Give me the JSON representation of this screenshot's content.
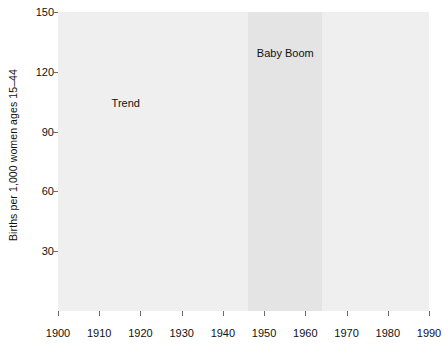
{
  "chart_data": {
    "type": "line",
    "title": "",
    "xlabel": "",
    "ylabel": "Births per 1,000 women ages 15–44",
    "xlim": [
      1900,
      1990
    ],
    "ylim": [
      0,
      150
    ],
    "yticks": [
      150,
      120,
      90,
      60,
      30
    ],
    "xticks": [
      1900,
      1910,
      1920,
      1930,
      1940,
      1950,
      1960,
      1970,
      1980,
      1990
    ],
    "grid": "horizontal-white",
    "legend": "none",
    "annotations": [
      {
        "text": "Trend",
        "x": 1913,
        "y": 104
      },
      {
        "text": "Baby Boom",
        "x": 1956,
        "y": 129
      }
    ],
    "shaded_bands": [
      {
        "label": "pre-boom",
        "x0": 1900,
        "x1": 1946,
        "color": "#efefef"
      },
      {
        "label": "baby-boom",
        "x0": 1946,
        "x1": 1964,
        "color": "#e4e4e4"
      },
      {
        "label": "post-boom",
        "x0": 1964,
        "x1": 1990,
        "color": "#efefef"
      }
    ],
    "series": [
      {
        "name": "Birth rate",
        "color": "#4a4a4a",
        "width": 2.6,
        "x": [
          1900,
          1901,
          1902,
          1903,
          1904,
          1905,
          1906,
          1907,
          1908,
          1909,
          1910,
          1911,
          1912,
          1913,
          1914,
          1915,
          1916,
          1917,
          1918,
          1919,
          1920,
          1921,
          1922,
          1923,
          1924,
          1925,
          1926,
          1927,
          1928,
          1929,
          1930,
          1931,
          1932,
          1933,
          1934,
          1935,
          1936,
          1937,
          1938,
          1939,
          1940,
          1941,
          1942,
          1943,
          1944,
          1945,
          1946,
          1947,
          1948,
          1949,
          1950,
          1951,
          1952,
          1953,
          1954,
          1955,
          1956,
          1957,
          1958,
          1959,
          1960,
          1961,
          1962,
          1963,
          1964,
          1965,
          1966,
          1967,
          1968,
          1969,
          1970,
          1971,
          1972,
          1973,
          1974,
          1975,
          1976,
          1977,
          1978,
          1979,
          1980,
          1981,
          1982,
          1983,
          1984,
          1985,
          1986,
          1987,
          1988,
          1989,
          1990
        ],
        "values": [
          120.0,
          120.5,
          121.0,
          121.0,
          121.5,
          122.0,
          122.5,
          123.0,
          124.0,
          124.5,
          126.5,
          126.0,
          126.5,
          127.0,
          127.0,
          126.5,
          124.0,
          123.0,
          121.0,
          111.5,
          117.5,
          118.5,
          112.5,
          111.0,
          110.5,
          108.0,
          104.0,
          101.5,
          97.0,
          93.5,
          89.5,
          85.0,
          81.5,
          76.5,
          78.5,
          77.0,
          76.0,
          77.5,
          79.0,
          77.5,
          79.5,
          83.5,
          91.5,
          95.5,
          88.5,
          86.0,
          101.5,
          122.5,
          114.0,
          113.5,
          113.0,
          115.5,
          116.5,
          116.5,
          118.0,
          118.5,
          120.0,
          121.0,
          119.5,
          118.5,
          118.0,
          117.0,
          113.0,
          108.0,
          104.5,
          97.0,
          91.5,
          87.0,
          85.5,
          86.5,
          87.5,
          82.0,
          73.5,
          69.5,
          68.0,
          66.5,
          65.0,
          66.0,
          65.5,
          67.0,
          68.0,
          67.5,
          67.0,
          66.0,
          66.0,
          66.5,
          65.5,
          66.0,
          67.5,
          69.0,
          70.5
        ]
      },
      {
        "name": "Trend",
        "color": "#8c8c8c",
        "width": 3.0,
        "x": [
          1900,
          1990
        ],
        "values": [
          120.5,
          60.5
        ]
      }
    ]
  },
  "axis": {
    "y_ticks": [
      "150",
      "120",
      "90",
      "60",
      "30"
    ],
    "x_ticks": [
      "1900",
      "1910",
      "1920",
      "1930",
      "1940",
      "1950",
      "1960",
      "1970",
      "1980",
      "1990"
    ],
    "y_title": "Births per 1,000 women ages 15–44"
  },
  "labels": {
    "trend": "Trend",
    "baby_boom": "Baby Boom"
  },
  "colors": {
    "plot_bg": "#efefef",
    "band_bg": "#e4e4e4",
    "grid": "#ffffff",
    "data_line": "#4a4a4a",
    "trend_line": "#8c8c8c",
    "text": "#111111",
    "page_bg": "#ffffff"
  }
}
